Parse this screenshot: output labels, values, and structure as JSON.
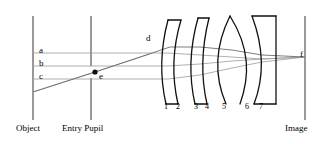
{
  "figure": {
    "type": "optical-ray-diagram",
    "title": "",
    "background_color": "#ffffff",
    "width": 328,
    "height": 144
  },
  "planes": [
    {
      "id": "object",
      "label": "Object",
      "x": 33,
      "y_top": 16,
      "y_bottom": 120,
      "label_x": 16,
      "label_y": 126
    },
    {
      "id": "entry-pupil",
      "label": "Entry Pupil",
      "x": 91,
      "y_top": 16,
      "y_bottom": 120,
      "label_x": 62,
      "label_y": 126
    },
    {
      "id": "image",
      "label": "Image",
      "x": 305,
      "y_top": 16,
      "y_bottom": 120,
      "label_x": 285,
      "label_y": 126
    }
  ],
  "rays": [
    {
      "id": "a",
      "label": "a",
      "label_x": 39,
      "label_y": 46,
      "color": "#8a8a8a"
    },
    {
      "id": "b",
      "label": "b",
      "label_x": 39,
      "label_y": 59,
      "color": "#8a8a8a"
    },
    {
      "id": "c",
      "label": "c",
      "label_x": 39,
      "label_y": 72,
      "color": "#8a8a8a"
    },
    {
      "id": "d",
      "label": "d",
      "label_x": 146,
      "label_y": 34,
      "color": "#6d6d6d"
    },
    {
      "id": "f",
      "label": "f",
      "label_x": 300,
      "label_y": 57,
      "color": "#8a8a8a"
    }
  ],
  "marker_points": [
    {
      "id": "e",
      "label": "e",
      "x": 95,
      "y": 72,
      "label_x": 99,
      "label_y": 78
    }
  ],
  "lens_surfaces": [
    {
      "number": "1",
      "label_x": 164,
      "label_y": 110
    },
    {
      "number": "2",
      "label_x": 176,
      "label_y": 110
    },
    {
      "number": "3",
      "label_x": 194,
      "label_y": 110
    },
    {
      "number": "4",
      "label_x": 204,
      "label_y": 110
    },
    {
      "number": "5",
      "label_x": 222,
      "label_y": 110
    },
    {
      "number": "6",
      "label_x": 245,
      "label_y": 110
    },
    {
      "number": "7",
      "label_x": 258,
      "label_y": 110
    }
  ],
  "colors": {
    "stroke_lens": "#111111",
    "stroke_plane": "#555555",
    "stroke_ray": "#9a9a9a",
    "stroke_chief_ray": "#6d6d6d",
    "text": "#000000"
  }
}
